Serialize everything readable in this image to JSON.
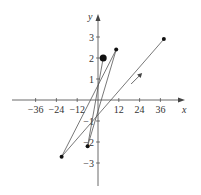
{
  "chart_data": {
    "type": "line",
    "title": "",
    "xlabel": "x",
    "ylabel": "y",
    "xlim": [
      -50,
      45
    ],
    "ylim": [
      -4.1,
      3.5
    ],
    "grid": false,
    "legend": null,
    "x_ticks": [
      -36,
      -24,
      -12,
      12,
      24,
      36
    ],
    "x_tick_labels": [
      "−36",
      "−24",
      "−12",
      "12",
      "24",
      "36"
    ],
    "y_ticks": [
      -3,
      -2,
      -1,
      1,
      2,
      3
    ],
    "y_tick_labels": [
      "−3",
      "−2",
      "−1",
      "1",
      "2",
      "3"
    ],
    "series": [
      {
        "name": "parametric curve",
        "points": [
          {
            "x": 3,
            "y": 2,
            "marker": "large-dot",
            "note": "start"
          },
          {
            "x": -6,
            "y": -2.2,
            "marker": "dot"
          },
          {
            "x": 10.5,
            "y": 2.4,
            "marker": "dot"
          },
          {
            "x": -21,
            "y": -2.7,
            "marker": "dot"
          },
          {
            "x": 38,
            "y": 2.9,
            "marker": "dot",
            "note": "end"
          }
        ]
      }
    ],
    "annotations": [
      {
        "type": "direction-arrow",
        "x": 22,
        "y": 1.0,
        "direction": "upper-right"
      }
    ]
  }
}
